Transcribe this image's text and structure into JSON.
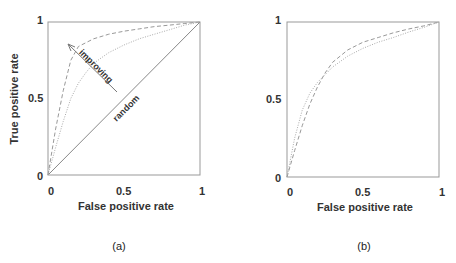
{
  "chart_data": [
    {
      "type": "line",
      "panel": "(a)",
      "title": "",
      "xlabel": "False positive rate",
      "ylabel": "True positive rate",
      "xlim": [
        0,
        1
      ],
      "ylim": [
        0,
        1
      ],
      "xticks": [
        "0",
        "0.5",
        "1"
      ],
      "yticks": [
        "0",
        "0.5",
        "1"
      ],
      "grid": false,
      "legend": null,
      "series": [
        {
          "name": "random",
          "style": "solid",
          "x": [
            0,
            1
          ],
          "y": [
            0,
            1
          ]
        },
        {
          "name": "better classifier",
          "style": "dashed",
          "x": [
            0,
            0.05,
            0.1,
            0.15,
            0.2,
            0.3,
            0.4,
            0.5,
            0.6,
            0.7,
            0.8,
            0.9,
            1.0
          ],
          "y": [
            0,
            0.3,
            0.55,
            0.75,
            0.84,
            0.89,
            0.92,
            0.94,
            0.955,
            0.97,
            0.98,
            0.99,
            1.0
          ]
        },
        {
          "name": "moderate classifier",
          "style": "dotted",
          "x": [
            0,
            0.05,
            0.1,
            0.15,
            0.2,
            0.25,
            0.3,
            0.4,
            0.5,
            0.6,
            0.7,
            0.8,
            0.9,
            1.0
          ],
          "y": [
            0,
            0.18,
            0.35,
            0.5,
            0.6,
            0.67,
            0.73,
            0.8,
            0.85,
            0.89,
            0.92,
            0.95,
            0.98,
            1.0
          ]
        }
      ],
      "annotations": [
        {
          "text": "improving",
          "type": "arrow",
          "from": [
            0.45,
            0.55
          ],
          "to": [
            0.12,
            0.86
          ]
        },
        {
          "text": "random",
          "type": "label",
          "at": [
            0.5,
            0.5
          ]
        }
      ]
    },
    {
      "type": "line",
      "panel": "(b)",
      "title": "",
      "xlabel": "False positive rate",
      "ylabel": "",
      "xlim": [
        0,
        1
      ],
      "ylim": [
        0,
        1
      ],
      "xticks": [
        "0",
        "0.5",
        "1"
      ],
      "yticks": [
        "0",
        "0.5",
        "1"
      ],
      "grid": false,
      "legend": null,
      "series": [
        {
          "name": "classifier A",
          "style": "dashed",
          "x": [
            0,
            0.05,
            0.1,
            0.15,
            0.2,
            0.25,
            0.3,
            0.4,
            0.5,
            0.6,
            0.7,
            0.8,
            0.9,
            1.0
          ],
          "y": [
            0,
            0.17,
            0.33,
            0.47,
            0.58,
            0.67,
            0.74,
            0.82,
            0.87,
            0.9,
            0.93,
            0.955,
            0.975,
            1.0
          ]
        },
        {
          "name": "classifier B",
          "style": "dotted",
          "x": [
            0,
            0.05,
            0.1,
            0.15,
            0.2,
            0.25,
            0.3,
            0.4,
            0.5,
            0.6,
            0.7,
            0.8,
            0.9,
            1.0
          ],
          "y": [
            0,
            0.25,
            0.43,
            0.54,
            0.61,
            0.66,
            0.71,
            0.78,
            0.83,
            0.87,
            0.9,
            0.935,
            0.965,
            1.0
          ]
        }
      ]
    }
  ],
  "panels": {
    "a": {
      "caption": "(a)",
      "xlabel": "False positive rate",
      "ylabel": "True positive rate",
      "xticks": [
        "0",
        "0.5",
        "1"
      ],
      "yticks": [
        "0",
        "0.5",
        "1"
      ],
      "annotation_improving": "improving",
      "annotation_random": "random"
    },
    "b": {
      "caption": "(b)",
      "xlabel": "False positive rate",
      "xticks": [
        "0",
        "0.5",
        "1"
      ],
      "yticks": [
        "0",
        "0.5",
        "1"
      ]
    }
  },
  "colors": {
    "axis": "#888888",
    "curve": "#999999",
    "text": "#333333"
  }
}
